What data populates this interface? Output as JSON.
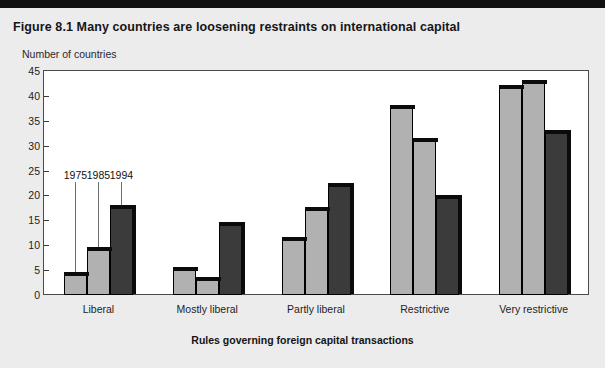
{
  "figure": {
    "title": "Figure 8.1  Many countries are loosening restraints on international capital",
    "top_rule_color": "#111111",
    "background_color": "#ececed",
    "plot_background_color": "#ffffff",
    "frame_color": "#4b4b4b"
  },
  "chart_data": {
    "type": "bar",
    "title": "Figure 8.1  Many countries are loosening restraints on international capital",
    "xlabel": "Rules governing foreign capital transactions",
    "ylabel": "Number of countries",
    "ylim": [
      0,
      45
    ],
    "yticks": [
      0,
      5,
      10,
      15,
      20,
      25,
      30,
      35,
      40,
      45
    ],
    "ytick_labels": [
      "0",
      "5",
      "10",
      "15",
      "20",
      "25",
      "30",
      "35",
      "40",
      "45"
    ],
    "grid": false,
    "legend_position": "inline-callouts",
    "categories": [
      "Liberal",
      "Mostly liberal",
      "Partly liberal",
      "Restrictive",
      "Very restrictive"
    ],
    "series": [
      {
        "name": "1975",
        "color": "#b1b1b1",
        "values": [
          4,
          5,
          11,
          37.5,
          41.5
        ]
      },
      {
        "name": "1985",
        "color": "#b1b1b1",
        "values": [
          9,
          3,
          17,
          31,
          42.5
        ]
      },
      {
        "name": "1994",
        "color": "#3b3b3b",
        "values": [
          17.5,
          14,
          22,
          19.5,
          32.5
        ]
      }
    ],
    "annotations": [
      {
        "text": "1975",
        "points_to": "Liberal/1975"
      },
      {
        "text": "1985",
        "points_to": "Liberal/1985"
      },
      {
        "text": "1994",
        "points_to": "Liberal/1994"
      }
    ]
  }
}
